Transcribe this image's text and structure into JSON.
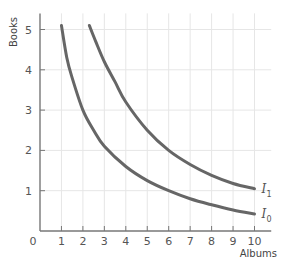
{
  "chart_data": {
    "type": "line",
    "title": "",
    "xlabel": "Albums",
    "ylabel": "Books",
    "xlim": [
      0,
      10.5
    ],
    "ylim": [
      0,
      5.4
    ],
    "grid": true,
    "legend": "inline labels at right end of curves",
    "x_ticks": [
      0,
      1,
      2,
      3,
      4,
      5,
      6,
      7,
      8,
      9,
      10
    ],
    "y_ticks": [
      0,
      1,
      2,
      3,
      4,
      5
    ],
    "series": [
      {
        "name": "I0",
        "label_main": "I",
        "label_sub": "0",
        "points": [
          [
            1,
            5.1
          ],
          [
            1.25,
            4.3
          ],
          [
            1.5,
            3.8
          ],
          [
            2,
            3.0
          ],
          [
            2.5,
            2.5
          ],
          [
            3,
            2.1
          ],
          [
            4,
            1.6
          ],
          [
            5,
            1.25
          ],
          [
            6,
            1.0
          ],
          [
            7,
            0.8
          ],
          [
            8,
            0.65
          ],
          [
            9,
            0.52
          ],
          [
            10,
            0.42
          ]
        ]
      },
      {
        "name": "I1",
        "label_main": "I",
        "label_sub": "1",
        "points": [
          [
            2.3,
            5.1
          ],
          [
            2.6,
            4.7
          ],
          [
            3,
            4.2
          ],
          [
            3.5,
            3.7
          ],
          [
            4,
            3.2
          ],
          [
            5,
            2.5
          ],
          [
            6,
            2.0
          ],
          [
            7,
            1.65
          ],
          [
            8,
            1.38
          ],
          [
            9,
            1.18
          ],
          [
            10,
            1.05
          ]
        ]
      }
    ],
    "colors": {
      "curve": "#666666",
      "axis": "#777777",
      "grid": "#e6e6e6"
    }
  }
}
